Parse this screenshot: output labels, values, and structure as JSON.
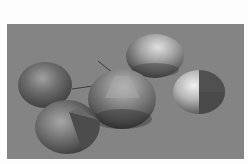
{
  "scene": {
    "description": "3D rendered scene of five shaded spheres on a gray ground plane",
    "background_color": "#848484",
    "frame_color": "#fdfdfd",
    "spheres": [
      {
        "name": "left-sphere",
        "cx": 38,
        "cy": 61,
        "rx": 27,
        "ry": 23,
        "base": "#5a5a5a",
        "highlight": "#9a9a9a",
        "cut": false
      },
      {
        "name": "bottom-left-sphere",
        "cx": 60,
        "cy": 103,
        "rx": 32,
        "ry": 27,
        "base": "#5e5e5e",
        "highlight": "#a2a2a2",
        "cut": true
      },
      {
        "name": "center-sphere",
        "cx": 115,
        "cy": 75,
        "rx": 34,
        "ry": 30,
        "base": "#5c5c5c",
        "highlight": "#b0b0b0",
        "cut": false
      },
      {
        "name": "top-sphere",
        "cx": 148,
        "cy": 32,
        "rx": 29,
        "ry": 22,
        "base": "#6a6a6a",
        "highlight": "#c8c8c8",
        "cut": false
      },
      {
        "name": "right-sphere",
        "cx": 192,
        "cy": 68,
        "rx": 26,
        "ry": 22,
        "base": "#4e4e4e",
        "highlight": "#d8d8d8",
        "cut": true
      }
    ],
    "lines": [
      {
        "name": "axis-line-upper",
        "x1": 91,
        "y1": 37,
        "x2": 106,
        "y2": 49
      },
      {
        "name": "axis-line-lower",
        "x1": 65,
        "y1": 65,
        "x2": 86,
        "y2": 62
      }
    ]
  }
}
